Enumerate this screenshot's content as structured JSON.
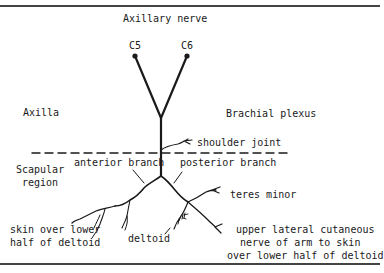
{
  "title": "Axillary nerve",
  "roots": [
    {
      "label": "C5"
    },
    {
      "label": "C6"
    }
  ],
  "regions": {
    "axilla": "Axilla",
    "brachial_plexus": "Brachial plexus",
    "scapular_region_line1": "Scapular",
    "scapular_region_line2": "region"
  },
  "branches": {
    "shoulder_joint": "shoulder joint",
    "anterior_branch": "anterior branch",
    "posterior_branch": "posterior branch",
    "teres_minor": "teres minor",
    "deltoid": "deltoid",
    "skin_lower_deltoid_line1": "skin over lower",
    "skin_lower_deltoid_line2": "half of deltoid",
    "upper_lateral_line1": "upper lateral cutaneous",
    "upper_lateral_line2": "nerve of arm to skin",
    "upper_lateral_line3": "over lower half of deltoid"
  },
  "colors": {
    "ink": "#1a1a1a",
    "frame": "#444444",
    "background": "#ffffff"
  }
}
